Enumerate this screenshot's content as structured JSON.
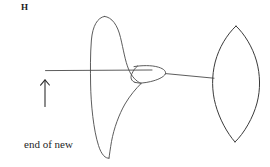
{
  "figure": {
    "panel_label": "H",
    "caption_line1": "end of new",
    "caption_line2": "thread",
    "background_color": "#ffffff",
    "ink_color": "#4a4a4a",
    "label_color": "#1a1a1a"
  },
  "diagram_data": {
    "type": "line-drawing",
    "subject": "bookbinding sewing diagram: new thread tied onto existing thread",
    "elements": [
      {
        "name": "existing-thread-left",
        "description": "horizontal thread segment entering from the left",
        "x_range": [
          45,
          152
        ],
        "y": 70
      },
      {
        "name": "new-thread-large-loop",
        "description": "tall vertical loop of the new thread crossing the horizontal thread",
        "top": [
          105,
          16
        ],
        "bottom": [
          109,
          158
        ],
        "left_x": 91
      },
      {
        "name": "knot-small-loop",
        "description": "small almond-shaped loop forming the knot",
        "center": [
          150,
          74
        ],
        "width": 32,
        "height": 17
      },
      {
        "name": "existing-thread-right",
        "description": "horizontal thread segment running right to the lens loop",
        "x_range": [
          166,
          214
        ],
        "y": 78
      },
      {
        "name": "lens-loop",
        "description": "large pointed-oval (vesica) loop of thread at the right",
        "top_tip": [
          236,
          26
        ],
        "bottom_tip": [
          235,
          142
        ],
        "left_x": 213,
        "right_x": 260
      },
      {
        "name": "direction-arrow",
        "description": "upward arrow indicating the end of the new thread",
        "tail": [
          45,
          106
        ],
        "head": [
          45,
          80
        ]
      }
    ]
  }
}
